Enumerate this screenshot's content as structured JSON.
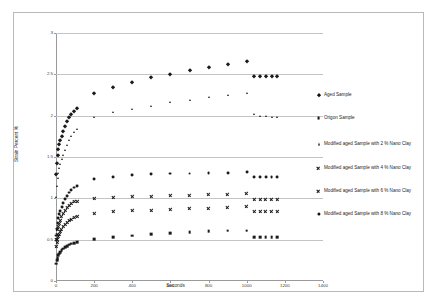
{
  "chart_data": {
    "type": "scatter",
    "title": "",
    "xlabel": "Seconds",
    "ylabel": "Strain Percent %",
    "xlim": [
      0,
      1400
    ],
    "ylim": [
      0,
      3
    ],
    "xticks": [
      0,
      200,
      400,
      600,
      800,
      1000,
      1200,
      1400
    ],
    "yticks": [
      0,
      0.5,
      1,
      1.5,
      2,
      2.5,
      3
    ],
    "xtick_labels": [
      "0",
      "200",
      "400",
      "600",
      "800",
      "1000",
      "1200",
      "1400"
    ],
    "ytick_labels": [
      "0",
      "0.5",
      "1",
      "1.5",
      "2",
      "2.5",
      "3"
    ],
    "grid": "horizontal",
    "legend_position": "right",
    "series": [
      {
        "name": "Aged Sample",
        "marker": "diamond",
        "color": "#1a1a1a",
        "x": [
          2,
          5,
          8,
          12,
          17,
          23,
          30,
          38,
          47,
          57,
          68,
          80,
          95,
          110,
          200,
          300,
          400,
          500,
          600,
          700,
          800,
          900,
          1000,
          1040,
          1070,
          1100,
          1130,
          1160
        ],
        "y": [
          1.3,
          1.43,
          1.52,
          1.6,
          1.66,
          1.71,
          1.76,
          1.82,
          1.88,
          1.93,
          1.98,
          2.02,
          2.06,
          2.09,
          2.27,
          2.35,
          2.41,
          2.47,
          2.51,
          2.55,
          2.59,
          2.63,
          2.66,
          2.48,
          2.48,
          2.48,
          2.48,
          2.48
        ]
      },
      {
        "name": "Origon Sample",
        "marker": "square",
        "color": "#1a1a1a",
        "x": [
          2,
          5,
          8,
          12,
          17,
          23,
          30,
          38,
          47,
          57,
          68,
          80,
          95,
          110,
          200,
          300,
          400,
          500,
          600,
          700,
          800,
          900,
          1000,
          1040,
          1070,
          1100,
          1130,
          1160
        ],
        "y": [
          0.21,
          0.25,
          0.28,
          0.31,
          0.33,
          0.35,
          0.37,
          0.39,
          0.41,
          0.42,
          0.44,
          0.45,
          0.46,
          0.47,
          0.51,
          0.53,
          0.55,
          0.57,
          0.58,
          0.59,
          0.6,
          0.61,
          0.61,
          0.53,
          0.53,
          0.53,
          0.53,
          0.53
        ]
      },
      {
        "name": "Modified aged Sample with 2 % Nano Clay",
        "marker": "triangle",
        "color": "#1a1a1a",
        "x": [
          2,
          5,
          8,
          12,
          17,
          23,
          30,
          38,
          47,
          57,
          68,
          80,
          95,
          110,
          200,
          300,
          400,
          500,
          600,
          700,
          800,
          900,
          1000,
          1040,
          1070,
          1100,
          1130,
          1160
        ],
        "y": [
          1.02,
          1.15,
          1.24,
          1.31,
          1.37,
          1.42,
          1.47,
          1.53,
          1.59,
          1.65,
          1.7,
          1.75,
          1.8,
          1.84,
          1.98,
          2.04,
          2.08,
          2.12,
          2.16,
          2.19,
          2.22,
          2.25,
          2.28,
          2.02,
          2.0,
          1.99,
          1.98,
          1.98
        ]
      },
      {
        "name": "Modified aged Sample with 4 % Nano Clay",
        "marker": "cross",
        "color": "#1a1a1a",
        "x": [
          2,
          5,
          8,
          12,
          17,
          23,
          30,
          38,
          47,
          57,
          68,
          80,
          95,
          110,
          200,
          300,
          400,
          500,
          600,
          700,
          800,
          900,
          1000,
          1040,
          1070,
          1100,
          1130,
          1160
        ],
        "y": [
          0.5,
          0.57,
          0.62,
          0.66,
          0.7,
          0.74,
          0.78,
          0.82,
          0.86,
          0.89,
          0.92,
          0.94,
          0.96,
          0.97,
          1.0,
          1.01,
          1.02,
          1.03,
          1.04,
          1.04,
          1.05,
          1.05,
          1.06,
          0.99,
          0.99,
          0.99,
          0.99,
          0.99
        ]
      },
      {
        "name": "Modified aged Sample with 6 % Nano Clay",
        "marker": "cross-thin",
        "color": "#1a1a1a",
        "x": [
          2,
          5,
          8,
          12,
          17,
          23,
          30,
          38,
          47,
          57,
          68,
          80,
          95,
          110,
          200,
          300,
          400,
          500,
          600,
          700,
          800,
          900,
          1000,
          1040,
          1070,
          1100,
          1130,
          1160
        ],
        "y": [
          0.42,
          0.47,
          0.51,
          0.54,
          0.57,
          0.6,
          0.63,
          0.66,
          0.69,
          0.71,
          0.73,
          0.75,
          0.77,
          0.78,
          0.82,
          0.84,
          0.85,
          0.86,
          0.87,
          0.88,
          0.88,
          0.89,
          0.9,
          0.84,
          0.84,
          0.84,
          0.84,
          0.84
        ]
      },
      {
        "name": "Modified aged Sample with 8 % Nano Clay",
        "marker": "circle",
        "color": "#1a1a1a",
        "x": [
          2,
          5,
          8,
          12,
          17,
          23,
          30,
          38,
          47,
          57,
          68,
          80,
          95,
          110,
          200,
          300,
          400,
          500,
          600,
          700,
          800,
          900,
          1000,
          1040,
          1070,
          1100,
          1130,
          1160
        ],
        "y": [
          0.55,
          0.63,
          0.7,
          0.76,
          0.81,
          0.85,
          0.89,
          0.94,
          0.99,
          1.03,
          1.07,
          1.1,
          1.13,
          1.15,
          1.23,
          1.26,
          1.28,
          1.29,
          1.3,
          1.3,
          1.31,
          1.31,
          1.32,
          1.26,
          1.26,
          1.26,
          1.26,
          1.26
        ]
      }
    ]
  },
  "legend": {
    "items": [
      {
        "label": "Aged Sample",
        "marker": "diamond"
      },
      {
        "label": "Origon Sample",
        "marker": "square"
      },
      {
        "label": "Modified aged Sample with 2 % Nano Clay",
        "marker": "triangle"
      },
      {
        "label": "Modified aged Sample with 4 % Nano Clay",
        "marker": "cross"
      },
      {
        "label": "Modified aged Sample with 6 % Nano Clay",
        "marker": "cross-thin"
      },
      {
        "label": "Modified aged Sample with 8 % Nano Clay",
        "marker": "circle"
      }
    ]
  },
  "axes": {
    "x_title": "Seconds",
    "y_title": "Strain Percent %"
  }
}
